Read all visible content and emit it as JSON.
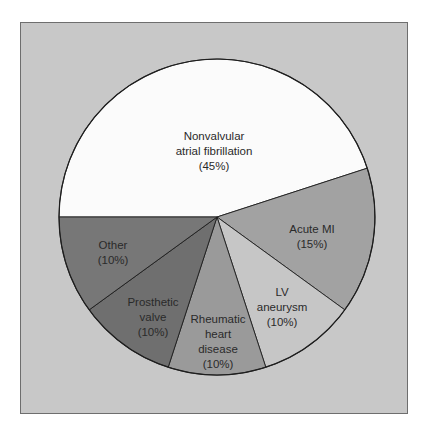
{
  "chart_data": {
    "type": "pie",
    "title": "",
    "start_angle_deg": 270,
    "direction": "clockwise",
    "slices": [
      {
        "label": "Nonvalvular\natrial fibrillation",
        "pct_label": "(45%)",
        "value": 45,
        "color": "#fbfbfb"
      },
      {
        "label": "Acute MI",
        "pct_label": "(15%)",
        "value": 15,
        "color": "#a2a2a2"
      },
      {
        "label": "LV\naneurysm",
        "pct_label": "(10%)",
        "value": 10,
        "color": "#c6c6c6"
      },
      {
        "label": "Rheumatic\nheart\ndisease",
        "pct_label": "(10%)",
        "value": 10,
        "color": "#9a9a9a"
      },
      {
        "label": "Prosthetic\nvalve",
        "pct_label": "(10%)",
        "value": 10,
        "color": "#6f6f6f"
      },
      {
        "label": "Other",
        "pct_label": "(10%)",
        "value": 10,
        "color": "#777777"
      }
    ]
  },
  "labels": {
    "nonvalvular": "Nonvalvular\natrial fibrillation\n(45%)",
    "acute_mi": "Acute MI\n(15%)",
    "lv_aneurysm": "LV\naneurysm\n(10%)",
    "rheumatic": "Rheumatic\nheart\ndisease\n(10%)",
    "prosthetic": "Prosthetic\nvalve\n(10%)",
    "other": "Other\n(10%)"
  },
  "colors": {
    "background": "#c8c8c8",
    "frame_border": "#6e6e6e",
    "slice_outline": "#1e1e1e"
  }
}
